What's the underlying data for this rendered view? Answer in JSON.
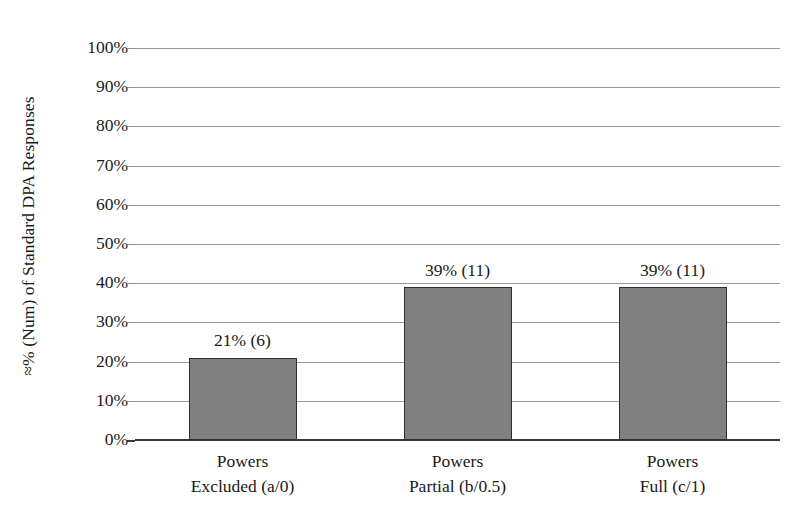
{
  "chart_data": {
    "type": "bar",
    "title": "",
    "xlabel": "",
    "ylabel": "≈% (Num) of Standard DPA Responses",
    "ylim": [
      0,
      100
    ],
    "grid": true,
    "legend": "none",
    "categories": [
      "Powers Excluded (a/0)",
      "Powers Partial (b/0.5)",
      "Powers Full (c/1)"
    ],
    "category_lines": [
      [
        "Powers",
        "Excluded (a/0)"
      ],
      [
        "Powers",
        "Partial (b/0.5)"
      ],
      [
        "Powers",
        "Full (c/1)"
      ]
    ],
    "values": [
      21,
      39,
      39
    ],
    "counts": [
      6,
      11,
      11
    ],
    "data_labels": [
      "21% (6)",
      "39% (11)",
      "39% (11)"
    ],
    "ytick_labels": [
      "100%",
      "90%",
      "80%",
      "70%",
      "60%",
      "50%",
      "40%",
      "30%",
      "20%",
      "10%",
      "0%"
    ],
    "ytick_values": [
      100,
      90,
      80,
      70,
      60,
      50,
      40,
      30,
      20,
      10,
      0
    ],
    "colors": {
      "bar_fill": "#808080",
      "bar_border": "#2e2e2e",
      "gridline": "#9a9a9a",
      "axis": "#3a3a3a",
      "text": "#1a1a1a",
      "background": "#ffffff"
    }
  }
}
